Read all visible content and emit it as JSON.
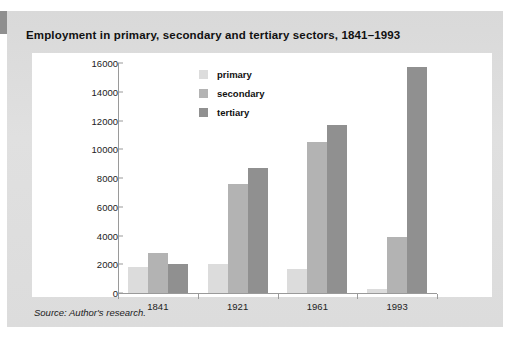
{
  "figure": {
    "title": "Employment in primary, secondary and tertiary sectors, 1841–1993",
    "source_note": "Source: Author's research.",
    "panel_color": "#dcdcdc",
    "card_color": "#ffffff"
  },
  "chart_data": {
    "type": "bar",
    "title": "Employment in primary, secondary and tertiary sectors, 1841–1993",
    "xlabel": "",
    "ylabel": "",
    "categories": [
      "1841",
      "1921",
      "1961",
      "1993"
    ],
    "series": [
      {
        "name": "primary",
        "color": "#dcdcdc",
        "values": [
          1800,
          2050,
          1650,
          300
        ]
      },
      {
        "name": "secondary",
        "color": "#b3b3b3",
        "values": [
          2800,
          7600,
          10500,
          3900
        ]
      },
      {
        "name": "tertiary",
        "color": "#909090",
        "values": [
          2050,
          8700,
          11700,
          15700
        ]
      }
    ],
    "ylim": [
      0,
      16000
    ],
    "yticks": [
      0,
      2000,
      4000,
      6000,
      8000,
      10000,
      12000,
      14000,
      16000
    ],
    "ytick_labels": [
      "0",
      "2000",
      "4000",
      "6000",
      "8000",
      "10000",
      "12000",
      "14000",
      "16000"
    ],
    "grid": false,
    "legend_position": "upper center",
    "legend_entries": [
      "primary",
      "secondary",
      "tertiary"
    ]
  }
}
